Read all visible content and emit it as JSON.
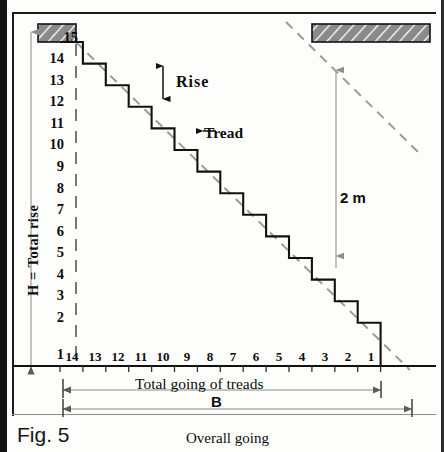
{
  "figure": {
    "number": "Fig. 5",
    "caption": "Overall going"
  },
  "axes": {
    "vertical_label": "H = Total rise",
    "vertical_ticks": [
      "15",
      "14",
      "13",
      "12",
      "11",
      "10",
      "9",
      "8",
      "7",
      "6",
      "5",
      "4",
      "3",
      "2",
      "1"
    ],
    "horizontal_ticks": [
      "14",
      "13",
      "12",
      "11",
      "10",
      "9",
      "8",
      "7",
      "6",
      "5",
      "4",
      "3",
      "2",
      "1"
    ],
    "horizontal_first_label": "1"
  },
  "annotations": {
    "rise": "Rise",
    "tread": "Tread",
    "headroom": "2 m"
  },
  "dimensions": {
    "going_label": "Total going of treads",
    "overall_label": "B"
  },
  "geometry": {
    "risers": 15,
    "treads": 14,
    "tread_px": 22.9,
    "riser_px": 21.6,
    "origin_x": 60,
    "baseline_y": 366,
    "top_y": 42
  },
  "colors": {
    "ink": "#111111",
    "hatch_fill": "#8a8a8a",
    "dashed": "#9b9b9b",
    "frame": "#1b1b1b"
  },
  "icons": {
    "rise_arrow": "double-arrow-vertical",
    "tread_arrow": "arrow-left",
    "headroom_arrow": "arrow-up",
    "dim_arrow": "dimension-arrow"
  }
}
